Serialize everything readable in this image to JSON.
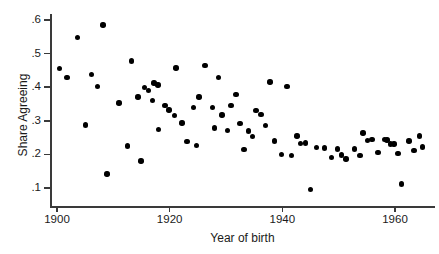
{
  "chart_data": {
    "type": "scatter",
    "title": "",
    "xlabel": "Year of birth",
    "ylabel": "Share Agreeing",
    "xlim": [
      1897,
      1967
    ],
    "ylim": [
      0.075,
      0.625
    ],
    "xticks": [
      1900,
      1920,
      1940,
      1960
    ],
    "xticklabels": [
      "1900",
      "1920",
      "1940",
      "1960"
    ],
    "yticks": [
      0.1,
      0.2,
      0.3,
      0.4,
      0.5,
      0.6
    ],
    "yticklabels": [
      ".1",
      ".2",
      ".3",
      ".4",
      ".5",
      ".6"
    ],
    "grid": false,
    "legend": null,
    "marker": "filled-circle",
    "marker_color": "#000000",
    "points": [
      {
        "x": 1900.4,
        "y": 0.455
      },
      {
        "x": 1901.8,
        "y": 0.428
      },
      {
        "x": 1903.6,
        "y": 0.548
      },
      {
        "x": 1905.1,
        "y": 0.287
      },
      {
        "x": 1906.1,
        "y": 0.437
      },
      {
        "x": 1907.2,
        "y": 0.402
      },
      {
        "x": 1908.2,
        "y": 0.585
      },
      {
        "x": 1908.9,
        "y": 0.142
      },
      {
        "x": 1911.0,
        "y": 0.353
      },
      {
        "x": 1912.5,
        "y": 0.225
      },
      {
        "x": 1913.2,
        "y": 0.478
      },
      {
        "x": 1914.4,
        "y": 0.371
      },
      {
        "x": 1914.9,
        "y": 0.18
      },
      {
        "x": 1915.5,
        "y": 0.4
      },
      {
        "x": 1916.2,
        "y": 0.39
      },
      {
        "x": 1916.9,
        "y": 0.361
      },
      {
        "x": 1917.2,
        "y": 0.412
      },
      {
        "x": 1917.9,
        "y": 0.406
      },
      {
        "x": 1918.0,
        "y": 0.275
      },
      {
        "x": 1919.2,
        "y": 0.345
      },
      {
        "x": 1919.9,
        "y": 0.332
      },
      {
        "x": 1920.9,
        "y": 0.316
      },
      {
        "x": 1921.1,
        "y": 0.457
      },
      {
        "x": 1922.2,
        "y": 0.293
      },
      {
        "x": 1923.1,
        "y": 0.238
      },
      {
        "x": 1924.2,
        "y": 0.34
      },
      {
        "x": 1924.8,
        "y": 0.227
      },
      {
        "x": 1925.2,
        "y": 0.371
      },
      {
        "x": 1926.3,
        "y": 0.465
      },
      {
        "x": 1927.6,
        "y": 0.34
      },
      {
        "x": 1928.0,
        "y": 0.278
      },
      {
        "x": 1928.7,
        "y": 0.428
      },
      {
        "x": 1929.3,
        "y": 0.317
      },
      {
        "x": 1930.3,
        "y": 0.272
      },
      {
        "x": 1930.9,
        "y": 0.345
      },
      {
        "x": 1931.8,
        "y": 0.378
      },
      {
        "x": 1932.5,
        "y": 0.292
      },
      {
        "x": 1933.2,
        "y": 0.215
      },
      {
        "x": 1934.0,
        "y": 0.27
      },
      {
        "x": 1934.7,
        "y": 0.253
      },
      {
        "x": 1935.3,
        "y": 0.33
      },
      {
        "x": 1936.2,
        "y": 0.318
      },
      {
        "x": 1937.0,
        "y": 0.286
      },
      {
        "x": 1937.8,
        "y": 0.416
      },
      {
        "x": 1938.6,
        "y": 0.24
      },
      {
        "x": 1939.9,
        "y": 0.199
      },
      {
        "x": 1940.8,
        "y": 0.402
      },
      {
        "x": 1941.6,
        "y": 0.197
      },
      {
        "x": 1942.6,
        "y": 0.255
      },
      {
        "x": 1943.2,
        "y": 0.232
      },
      {
        "x": 1944.1,
        "y": 0.234
      },
      {
        "x": 1945.0,
        "y": 0.095
      },
      {
        "x": 1946.1,
        "y": 0.221
      },
      {
        "x": 1947.5,
        "y": 0.219
      },
      {
        "x": 1948.7,
        "y": 0.191
      },
      {
        "x": 1949.8,
        "y": 0.216
      },
      {
        "x": 1950.5,
        "y": 0.198
      },
      {
        "x": 1951.3,
        "y": 0.186
      },
      {
        "x": 1952.8,
        "y": 0.216
      },
      {
        "x": 1953.8,
        "y": 0.196
      },
      {
        "x": 1954.3,
        "y": 0.264
      },
      {
        "x": 1955.1,
        "y": 0.241
      },
      {
        "x": 1955.9,
        "y": 0.244
      },
      {
        "x": 1957.0,
        "y": 0.205
      },
      {
        "x": 1958.1,
        "y": 0.245
      },
      {
        "x": 1958.6,
        "y": 0.243
      },
      {
        "x": 1959.2,
        "y": 0.231
      },
      {
        "x": 1959.8,
        "y": 0.231
      },
      {
        "x": 1960.5,
        "y": 0.202
      },
      {
        "x": 1961.2,
        "y": 0.112
      },
      {
        "x": 1962.5,
        "y": 0.24
      },
      {
        "x": 1963.4,
        "y": 0.211
      },
      {
        "x": 1964.3,
        "y": 0.255
      },
      {
        "x": 1964.9,
        "y": 0.222
      }
    ]
  }
}
